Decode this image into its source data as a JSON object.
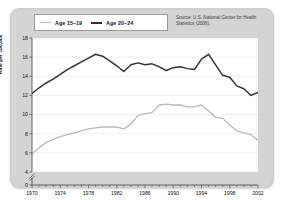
{
  "chart_data": {
    "type": "line",
    "title": "",
    "xlabel": "",
    "ylabel": "Rate per 100,000",
    "xlim": [
      1970,
      2002
    ],
    "ylim": [
      4,
      18
    ],
    "y_axis_break": true,
    "y_zero_shown": true,
    "yticks": [
      0,
      4,
      6,
      8,
      10,
      12,
      14,
      16,
      18
    ],
    "xticks": [
      1970,
      1974,
      1978,
      1982,
      1986,
      1990,
      1994,
      1998,
      2002
    ],
    "minor_x_tick_interval": 1,
    "grid": "horizontal",
    "legend_position": "top-left",
    "annotation": "Source: U.S. National Center for Health Statistics (2006).",
    "x": [
      1970,
      1971,
      1972,
      1973,
      1974,
      1975,
      1976,
      1977,
      1978,
      1979,
      1980,
      1981,
      1982,
      1983,
      1984,
      1985,
      1986,
      1987,
      1988,
      1989,
      1990,
      1991,
      1992,
      1993,
      1994,
      1995,
      1996,
      1997,
      1998,
      1999,
      2000,
      2001,
      2002
    ],
    "series": [
      {
        "name": "Age 15–19",
        "color": "#b9b9b9",
        "values": [
          5.9,
          6.5,
          7.1,
          7.4,
          7.7,
          7.9,
          8.1,
          8.3,
          8.5,
          8.6,
          8.7,
          8.7,
          8.7,
          8.5,
          9.0,
          9.9,
          10.1,
          10.2,
          11.0,
          11.1,
          11.0,
          11.0,
          10.8,
          10.8,
          11.0,
          10.4,
          9.7,
          9.6,
          8.9,
          8.3,
          8.1,
          7.9,
          7.3
        ]
      },
      {
        "name": "Age 20–24",
        "color": "#333333",
        "values": [
          12.2,
          12.8,
          13.3,
          13.7,
          14.2,
          14.7,
          15.1,
          15.5,
          15.9,
          16.3,
          16.1,
          15.6,
          15.1,
          14.5,
          15.2,
          15.4,
          15.2,
          15.3,
          15.0,
          14.6,
          14.9,
          15.0,
          14.8,
          14.7,
          15.8,
          16.3,
          15.2,
          14.1,
          13.9,
          13.0,
          12.7,
          12.0,
          12.3
        ]
      }
    ]
  },
  "legend": {
    "entries": [
      {
        "label": "Age 15–19",
        "style": "light"
      },
      {
        "label": "Age 20–24",
        "style": "dark"
      }
    ]
  },
  "source": {
    "text": "Source: U.S. National Center for Health Statistics (2006)."
  },
  "axes": {
    "ylabel": "Rate per 100,000",
    "yticks": [
      "18",
      "16",
      "14",
      "12",
      "10",
      "8",
      "6",
      "4",
      "0"
    ],
    "xticks": [
      "1970",
      "1974",
      "1978",
      "1982",
      "1986",
      "1990",
      "1994",
      "1998",
      "2002"
    ]
  }
}
